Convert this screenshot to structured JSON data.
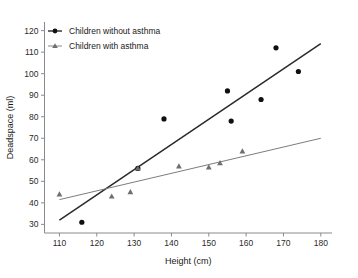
{
  "chart_data": {
    "type": "scatter",
    "title": "",
    "xlabel": "Height (cm)",
    "ylabel": "Deadspace (ml)",
    "xlim": [
      106,
      183
    ],
    "ylim": [
      26,
      124
    ],
    "xticks": [
      110,
      120,
      130,
      140,
      150,
      160,
      170,
      180
    ],
    "yticks": [
      30,
      40,
      50,
      60,
      70,
      80,
      90,
      100,
      110,
      120
    ],
    "grid": false,
    "legend_position": "top-left",
    "series": [
      {
        "name": "Children without asthma",
        "marker": "circle",
        "color": "#101010",
        "points": [
          {
            "x": 116,
            "y": 31
          },
          {
            "x": 131,
            "y": 56
          },
          {
            "x": 138,
            "y": 79
          },
          {
            "x": 155,
            "y": 92
          },
          {
            "x": 156,
            "y": 78
          },
          {
            "x": 164,
            "y": 88
          },
          {
            "x": 168,
            "y": 112
          },
          {
            "x": 174,
            "y": 101
          }
        ],
        "fit_line": {
          "x1": 110,
          "y1": 32,
          "x2": 180,
          "y2": 114
        }
      },
      {
        "name": "Children with asthma",
        "marker": "triangle",
        "color": "#6f6f6f",
        "points": [
          {
            "x": 110,
            "y": 44
          },
          {
            "x": 124,
            "y": 43
          },
          {
            "x": 129,
            "y": 45
          },
          {
            "x": 131,
            "y": 56
          },
          {
            "x": 142,
            "y": 57
          },
          {
            "x": 150,
            "y": 56.5
          },
          {
            "x": 153,
            "y": 58.5
          },
          {
            "x": 159,
            "y": 64
          }
        ],
        "fit_line": {
          "x1": 110,
          "y1": 41.5,
          "x2": 180,
          "y2": 70
        }
      }
    ]
  },
  "legend": {
    "entries": [
      {
        "label": "Children without asthma",
        "marker": "circle"
      },
      {
        "label": "Children with asthma",
        "marker": "triangle"
      }
    ]
  },
  "tick_labels": {
    "x": [
      "110",
      "120",
      "130",
      "140",
      "150",
      "160",
      "170",
      "180"
    ],
    "y": [
      "30",
      "40",
      "50",
      "60",
      "70",
      "80",
      "90",
      "100",
      "110",
      "120"
    ]
  },
  "labels": {
    "x_title": "Height (cm)",
    "y_title": "Deadspace (ml)"
  }
}
